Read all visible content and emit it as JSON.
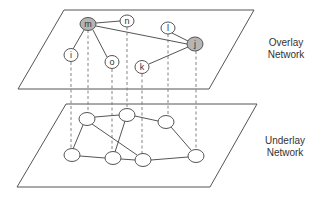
{
  "diagram": {
    "overlay": {
      "label_line1": "Overlay",
      "label_line2": "Network",
      "nodes": [
        {
          "id": "m",
          "label": "m",
          "highlighted": true
        },
        {
          "id": "n",
          "label": "n",
          "highlighted": false
        },
        {
          "id": "l",
          "label": "l",
          "highlighted": false
        },
        {
          "id": "j",
          "label": "j",
          "highlighted": true
        },
        {
          "id": "i",
          "label": "i",
          "highlighted": false
        },
        {
          "id": "o",
          "label": "o",
          "highlighted": false
        },
        {
          "id": "k",
          "label": "k",
          "highlighted": false
        }
      ],
      "edges": [
        [
          "m",
          "n"
        ],
        [
          "m",
          "i"
        ],
        [
          "m",
          "o"
        ],
        [
          "m",
          "j"
        ],
        [
          "l",
          "j"
        ],
        [
          "k",
          "j"
        ]
      ]
    },
    "underlay": {
      "label_line1": "Underlay",
      "label_line2": "Network",
      "node_count": 7
    },
    "colors": {
      "highlight_node": "#b5b5b5",
      "line": "#555555"
    }
  }
}
